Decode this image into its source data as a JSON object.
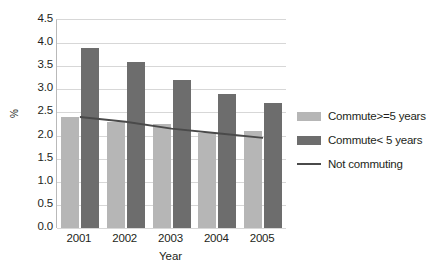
{
  "chart_data": {
    "type": "bar",
    "title": "",
    "xlabel": "Year",
    "ylabel": "%",
    "categories": [
      "2001",
      "2002",
      "2003",
      "2004",
      "2005"
    ],
    "ylim": [
      0.0,
      4.5
    ],
    "ytick_labels": [
      "4.5",
      "4.0",
      "3.5",
      "3.0",
      "2.5",
      "2.0",
      "1.5",
      "1.0",
      "0.5",
      "0.0"
    ],
    "ytick_values": [
      4.5,
      4.0,
      3.5,
      3.0,
      2.5,
      2.0,
      1.5,
      1.0,
      0.5,
      0.0
    ],
    "grid": true,
    "legend_position": "right",
    "series": [
      {
        "name": "Commute>=5 years",
        "type": "bar",
        "color": "#b6b6b6",
        "values": [
          2.4,
          2.3,
          2.25,
          2.05,
          2.1
        ]
      },
      {
        "name": "Commute< 5 years",
        "type": "bar",
        "color": "#6d6d6d",
        "values": [
          3.9,
          3.6,
          3.2,
          2.9,
          2.7
        ]
      },
      {
        "name": "Not commuting",
        "type": "line",
        "color": "#4a4a4a",
        "values": [
          2.4,
          2.3,
          2.15,
          2.05,
          1.95
        ]
      }
    ]
  },
  "legend": {
    "items": [
      {
        "label": "Commute>=5 years",
        "swatch": "light"
      },
      {
        "label": "Commute< 5 years",
        "swatch": "dark"
      },
      {
        "label": "Not commuting",
        "swatch": "line"
      }
    ]
  }
}
